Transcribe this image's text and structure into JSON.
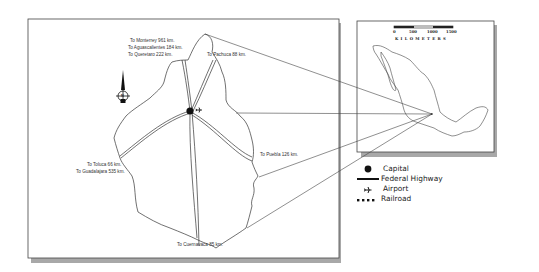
{
  "map": {
    "main_panel": {
      "road_labels": {
        "monterrey": "To Monterrey 961 km.",
        "aguascalientes": "To Aguascalientes 184 km.",
        "queretaro": "To Queretaro 222 km.",
        "pachuca": "To Pachuca 88 km.",
        "puebla": "To Puebla 126 km.",
        "toluca": "To Toluca 66 km.",
        "guadalajara": "To Guadalajara 535 km.",
        "cuernavaca": "To Cuernavaca 85 km."
      },
      "compass_letter": "N"
    },
    "inset_panel": {
      "scale_ticks": [
        "0",
        "500",
        "1000",
        "1500"
      ],
      "scale_unit": "K I L O M E T E R S"
    },
    "legend": {
      "items": [
        {
          "symbol": "capital-dot",
          "label": "Capital"
        },
        {
          "symbol": "highway-line",
          "label": "Federal Highway"
        },
        {
          "symbol": "airport-plane",
          "label": "Airport"
        },
        {
          "symbol": "railroad-dashes",
          "label": "Railroad"
        }
      ]
    },
    "colors": {
      "outline": "#333333",
      "shadow": "#9a9a9a",
      "background": "#ffffff"
    }
  }
}
